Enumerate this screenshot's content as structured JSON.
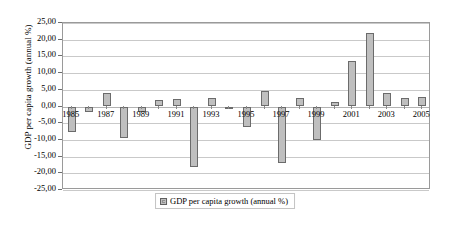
{
  "chart_data": {
    "type": "bar",
    "title": "",
    "xlabel": "",
    "ylabel": "GDP per capita growth (annual %)",
    "legend": [
      "GDP per capita growth (annual %)"
    ],
    "legend_position": "bottom",
    "grid": true,
    "ylim": [
      -25,
      25
    ],
    "ytick_step": 5,
    "ytick_labels": [
      "25,00",
      "20,00",
      "15,00",
      "10,00",
      "5,00",
      "0,00",
      "-5,00",
      "-10,00",
      "-15,00",
      "-20,00",
      "-25,00"
    ],
    "ytick_values": [
      25,
      20,
      15,
      10,
      5,
      0,
      -5,
      -10,
      -15,
      -20,
      -25
    ],
    "categories": [
      1985,
      1986,
      1987,
      1988,
      1989,
      1990,
      1991,
      1992,
      1993,
      1994,
      1995,
      1996,
      1997,
      1998,
      1999,
      2000,
      2001,
      2002,
      2003,
      2004,
      2005
    ],
    "xtick_labels": [
      "1985",
      "1987",
      "1989",
      "1991",
      "1993",
      "1995",
      "1997",
      "1999",
      "2001",
      "2003",
      "2005"
    ],
    "xtick_values": [
      1985,
      1987,
      1989,
      1991,
      1993,
      1995,
      1997,
      1999,
      2001,
      2003,
      2005
    ],
    "series": [
      {
        "name": "GDP per capita growth (annual %)",
        "color": "#bfbfbf",
        "border_color": "#6b6b6b",
        "values": [
          -7.5,
          -1.5,
          4.0,
          -9.5,
          -1.5,
          2.0,
          2.2,
          -18.0,
          2.5,
          -0.7,
          -6.0,
          4.7,
          -17.0,
          2.5,
          -10.0,
          1.2,
          13.5,
          22.0,
          4.0,
          2.5,
          2.8
        ]
      }
    ]
  },
  "legend": {
    "label": "GDP per capita growth (annual %)",
    "swatch_name": "legend-swatch"
  },
  "axes": {
    "y_title": "GDP per capita growth (annual %)"
  }
}
